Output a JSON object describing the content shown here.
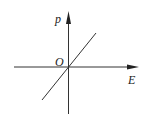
{
  "diagram": {
    "type": "coordinate-graph",
    "axes": {
      "x_label": "E",
      "y_label": "p",
      "origin_label": "O"
    },
    "line": {
      "description": "straight line through origin with positive slope",
      "relation": "p proportional to E"
    },
    "colors": {
      "stroke": "#222222",
      "background": "#ffffff"
    }
  }
}
